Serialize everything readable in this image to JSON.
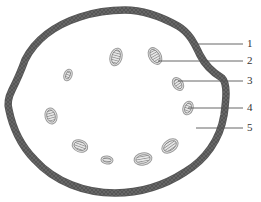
{
  "diagram": {
    "type": "cross-section",
    "outline": {
      "path": "M125,10 C140,10 160,16 178,26 C190,33 195,45 200,55 C205,65 212,72 222,78 C228,84 226,100 224,115 C220,140 205,160 185,172 C165,185 140,193 115,193 C85,193 55,182 35,160 C20,145 12,125 9,110 C7,104 8,98 12,90 C16,82 20,74 25,60 C35,40 55,25 80,17 C95,12 110,10 125,10 Z",
      "stroke_color": "#6b6b6b",
      "fill_color": "#ffffff",
      "band_width": 6
    },
    "bundles": [
      {
        "cx": 68,
        "cy": 75,
        "rx": 4,
        "ry": 6,
        "rotate": 20
      },
      {
        "cx": 116,
        "cy": 57,
        "rx": 6,
        "ry": 9,
        "rotate": 15
      },
      {
        "cx": 155,
        "cy": 56,
        "rx": 6,
        "ry": 9,
        "rotate": -30
      },
      {
        "cx": 178,
        "cy": 84,
        "rx": 5,
        "ry": 7,
        "rotate": -35
      },
      {
        "cx": 188,
        "cy": 108,
        "rx": 5,
        "ry": 7,
        "rotate": 20
      },
      {
        "cx": 51,
        "cy": 116,
        "rx": 6,
        "ry": 8,
        "rotate": -15
      },
      {
        "cx": 80,
        "cy": 146,
        "rx": 8,
        "ry": 6,
        "rotate": 20
      },
      {
        "cx": 107,
        "cy": 160,
        "rx": 6,
        "ry": 4,
        "rotate": 5
      },
      {
        "cx": 143,
        "cy": 159,
        "rx": 9,
        "ry": 6,
        "rotate": -10
      },
      {
        "cx": 170,
        "cy": 146,
        "rx": 9,
        "ry": 6,
        "rotate": -35
      }
    ],
    "callouts": [
      {
        "label": "1",
        "x1": 198,
        "y": 44,
        "x2": 243,
        "label_x": 250
      },
      {
        "label": "2",
        "x1": 158,
        "y": 61,
        "x2": 243,
        "label_x": 250
      },
      {
        "label": "3",
        "x1": 178,
        "y": 81,
        "x2": 243,
        "label_x": 250
      },
      {
        "label": "4",
        "x1": 188,
        "y": 108,
        "x2": 243,
        "label_x": 250
      },
      {
        "label": "5",
        "x1": 196,
        "y": 128,
        "x2": 243,
        "label_x": 250
      }
    ],
    "colors": {
      "line": "#555555",
      "hatch": "#7a7a7a",
      "bundle_outer": "#9a9a9a",
      "label": "#333333"
    }
  },
  "labels": {
    "l1": "1",
    "l2": "2",
    "l3": "3",
    "l4": "4",
    "l5": "5"
  }
}
